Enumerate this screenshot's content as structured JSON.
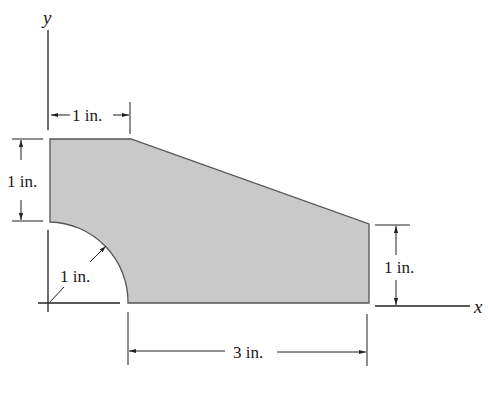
{
  "diagram": {
    "type": "engineering-shape-with-dimensions",
    "axes": {
      "x_label": "x",
      "y_label": "y"
    },
    "colors": {
      "shape_fill": "#c9c9c9",
      "shape_stroke": "#555555",
      "line": "#222222",
      "background": "#ffffff"
    },
    "dimensions": {
      "top_width": "1 in.",
      "left_height": "1 in.",
      "arc_radius": "1 in.",
      "right_height": "1 in.",
      "bottom_width": "3 in."
    }
  }
}
